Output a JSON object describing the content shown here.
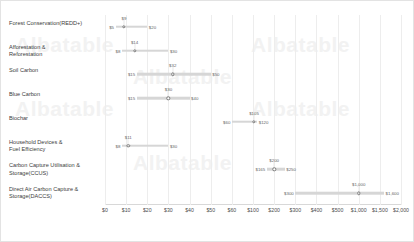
{
  "chart_data": {
    "type": "bar",
    "title": "",
    "subtitle": "",
    "xlabel": "",
    "ylabel": "",
    "orientation": "horizontal",
    "grid": true,
    "legend": false,
    "axis_type": "broken-piecewise",
    "xticks": [
      {
        "label": "$0",
        "value": 0
      },
      {
        "label": "$10",
        "value": 10
      },
      {
        "label": "$20",
        "value": 20
      },
      {
        "label": "$30",
        "value": 30
      },
      {
        "label": "$40",
        "value": 40
      },
      {
        "label": "$50",
        "value": 50
      },
      {
        "label": "$60",
        "value": 60
      },
      {
        "label": "$100",
        "value": 100
      },
      {
        "label": "$200",
        "value": 200
      },
      {
        "label": "$300",
        "value": 300
      },
      {
        "label": "$400",
        "value": 400
      },
      {
        "label": "$500",
        "value": 500
      },
      {
        "label": "$1,000",
        "value": 1000
      },
      {
        "label": "$1,500",
        "value": 1500
      },
      {
        "label": "$2,000",
        "value": 2000
      }
    ],
    "categories": [
      "Forest Conservation(REDD+)",
      "Afforestation & Reforestation",
      "Soil Carbon",
      "Blue Carbon",
      "Biochar",
      "Household Devices & Fuel Efficiency",
      "Carbon Capture Utilisation & Storage(CCUS)",
      "Direct Air Carbon Capture & Storage(DACCS)"
    ],
    "series": [
      {
        "name": "Cost range (USD per tonne CO2)",
        "rows": [
          {
            "category": "Forest Conservation(REDD+)",
            "low": 5,
            "mid": 9,
            "high": 20,
            "low_label": "$5",
            "mid_label": "$9",
            "high_label": "$20"
          },
          {
            "category": "Afforestation & Reforestation",
            "low": 8,
            "mid": 14,
            "high": 30,
            "low_label": "$8",
            "mid_label": "$14",
            "high_label": "$30"
          },
          {
            "category": "Soil Carbon",
            "low": 15,
            "mid": 32,
            "high": 50,
            "low_label": "$15",
            "mid_label": "$32",
            "high_label": "$50"
          },
          {
            "category": "Blue Carbon",
            "low": 15,
            "mid": 30,
            "high": 40,
            "low_label": "$15",
            "mid_label": "$30",
            "high_label": "$40"
          },
          {
            "category": "Biochar",
            "low": 60,
            "mid": 105,
            "high": 120,
            "low_label": "$60",
            "mid_label": "$105",
            "high_label": "$120"
          },
          {
            "category": "Household Devices & Fuel Efficiency",
            "low": 8,
            "mid": 11,
            "high": 30,
            "low_label": "$8",
            "mid_label": "$11",
            "high_label": "$30"
          },
          {
            "category": "Carbon Capture Utilisation & Storage(CCUS)",
            "low": 165,
            "mid": 200,
            "high": 250,
            "low_label": "$165",
            "mid_label": "$200",
            "high_label": "$250"
          },
          {
            "category": "Direct Air Carbon Capture & Storage(DACCS)",
            "low": 300,
            "mid": 1000,
            "high": 1600,
            "low_label": "$300",
            "mid_label": "$1,000",
            "high_label": "$1,600"
          }
        ]
      }
    ],
    "colors": {
      "track": "#d6d6d6",
      "marker_fill": "#ffffff",
      "marker_stroke": "#7a7a7a",
      "grid": "#ededed",
      "text": "#3c3c3c",
      "watermark": "#f2f2f2"
    }
  },
  "watermark": {
    "text": "Albatable",
    "instances": [
      "Albatable",
      "Albatable",
      "Albatable",
      "Albatable",
      "Albatable",
      "Albatable"
    ]
  }
}
